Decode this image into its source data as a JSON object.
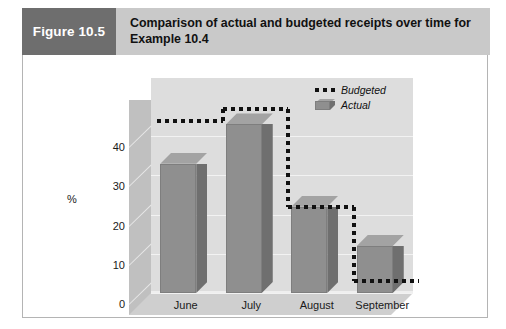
{
  "figure": {
    "tag": "Figure 10.5",
    "title_line1": "Comparison of actual and budgeted receipts over time for",
    "title_line2": "Example 10.4",
    "tag_bg": "#6e6e6e",
    "header_bg": "#c9c9c9"
  },
  "legend": {
    "position": "top-right",
    "entries": [
      {
        "label": "Budgeted",
        "style": "dotted-line",
        "color": "#111111"
      },
      {
        "label": "Actual",
        "style": "3d-bar",
        "color": "#8f8f8f"
      }
    ]
  },
  "chart_data": {
    "type": "bar",
    "title": "Comparison of actual and budgeted receipts over time for Example 10.4",
    "subtitle": "",
    "xlabel": "Time",
    "ylabel": "%",
    "categories": [
      "June",
      "July",
      "August",
      "September"
    ],
    "ylim": [
      0,
      48
    ],
    "yticks": [
      0,
      10,
      20,
      30,
      40
    ],
    "ytick_labels": [
      "0",
      "10",
      "20",
      "30",
      "40"
    ],
    "grid": true,
    "grid_axis": "y",
    "three_d": true,
    "series": [
      {
        "name": "Actual",
        "type": "bar",
        "color": "#8f8f8f",
        "values": [
          33,
          43,
          22,
          12
        ]
      },
      {
        "name": "Budgeted",
        "type": "step",
        "color": "#111111",
        "line_style": "dotted",
        "values": [
          44,
          47,
          22,
          3
        ]
      }
    ]
  }
}
